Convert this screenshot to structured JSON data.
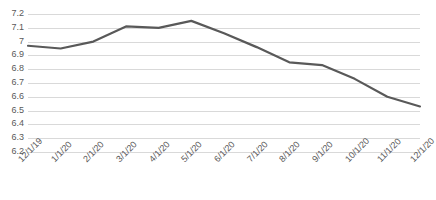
{
  "chart_data": {
    "type": "line",
    "title": "",
    "subtitle": "",
    "xlabel": "",
    "ylabel": "",
    "categories": [
      "12/1/19",
      "1/1/20",
      "2/1/20",
      "3/1/20",
      "4/1/20",
      "5/1/20",
      "6/1/20",
      "7/1/20",
      "8/1/20",
      "9/1/20",
      "10/1/20",
      "11/1/20",
      "12/1/20"
    ],
    "values": [
      6.97,
      6.95,
      7.0,
      7.11,
      7.1,
      7.15,
      7.06,
      6.96,
      6.85,
      6.83,
      6.73,
      6.6,
      6.53
    ],
    "series": [
      {
        "name": "series-1",
        "values": [
          6.97,
          6.95,
          7.0,
          7.11,
          7.1,
          7.15,
          7.06,
          6.96,
          6.85,
          6.83,
          6.73,
          6.6,
          6.53
        ]
      }
    ],
    "ylim": [
      6.2,
      7.2
    ],
    "yticks": [
      7.2,
      7.1,
      7,
      6.9,
      6.8,
      6.7,
      6.6,
      6.5,
      6.4,
      6.3,
      6.2
    ],
    "ytick_labels": [
      "7.2",
      "7.1",
      "7",
      "6.9",
      "6.8",
      "6.7",
      "6.6",
      "6.5",
      "6.4",
      "6.3",
      "6.2"
    ],
    "grid": true,
    "legend": false,
    "legend_position": "none",
    "line_color": "#595959",
    "gridline_color": "#D9D9D9",
    "tick_label_color": "#595959",
    "background_color": "#FFFFFF",
    "annotations": []
  }
}
